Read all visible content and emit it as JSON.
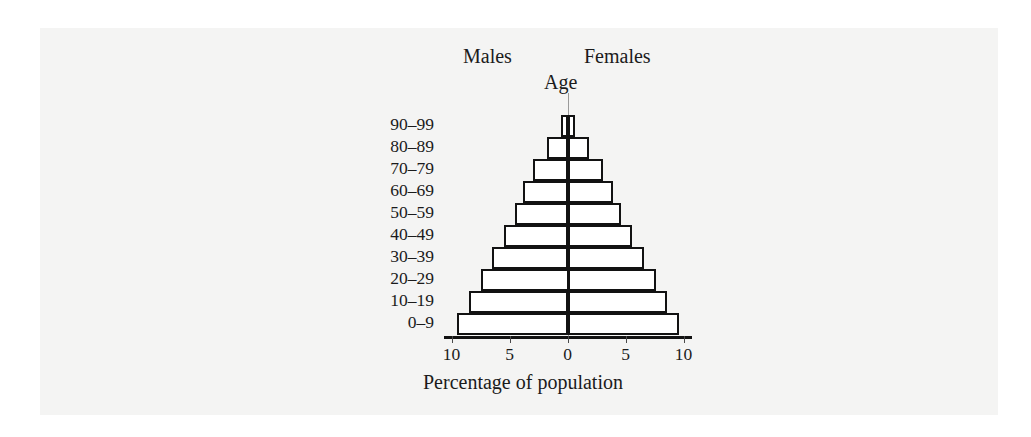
{
  "figure": {
    "males_label": "Males",
    "females_label": "Females",
    "age_label": "Age",
    "xaxis_caption": "Percentage of population"
  },
  "colors": {
    "page_background": "#f4f4f3",
    "outside_background": "#ffffff",
    "bar_fill": "#ffffff",
    "bar_outline": "#121212",
    "axis": "#121212",
    "center_line": "#9a9a9a",
    "text": "#1b1b1b"
  },
  "chart_data": {
    "type": "bar",
    "title": "",
    "subtitle": "",
    "xlabel": "Percentage of population",
    "ylabel": "Age",
    "orientation": "horizontal",
    "style": "population-pyramid",
    "grid": false,
    "legend_position": "top",
    "legend": [
      "Males",
      "Females"
    ],
    "categories": [
      "90–99",
      "80–89",
      "70–79",
      "60–69",
      "50–59",
      "40–49",
      "30–39",
      "20–29",
      "10–19",
      "0–9"
    ],
    "xlim": [
      -10,
      10
    ],
    "xticks": [
      -10,
      -5,
      0,
      5,
      10
    ],
    "xtick_labels": [
      "10",
      "5",
      "0",
      "5",
      "10"
    ],
    "series": [
      {
        "name": "Males",
        "side": "left",
        "values": [
          0.6,
          1.8,
          3.0,
          3.8,
          4.5,
          5.5,
          6.5,
          7.5,
          8.5,
          9.5
        ]
      },
      {
        "name": "Females",
        "side": "right",
        "values": [
          0.6,
          1.8,
          3.0,
          3.8,
          4.5,
          5.5,
          6.5,
          7.5,
          8.5,
          9.5
        ]
      }
    ]
  }
}
